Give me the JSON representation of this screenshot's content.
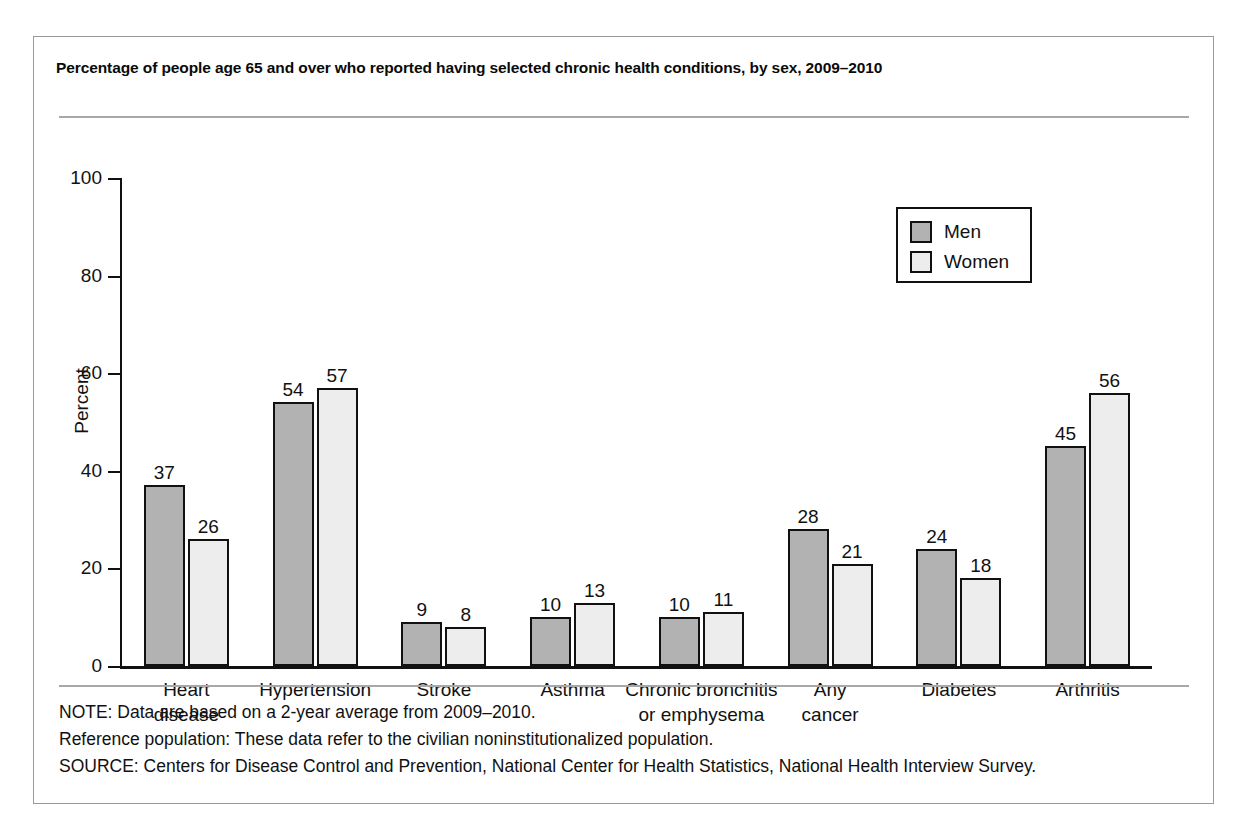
{
  "figure": {
    "title": "Percentage of people age 65 and over who reported having selected chronic health conditions, by sex, 2009–2010"
  },
  "footer": {
    "note": "NOTE: Data are based on a 2-year average from 2009–2010.",
    "reference": "Reference population: These data refer to the civilian noninstitutionalized population.",
    "source": "SOURCE: Centers for Disease Control and Prevention, National Center for Health Statistics, National Health Interview Survey."
  },
  "legend": {
    "items": [
      {
        "label": "Men",
        "color": "#b2b2b2"
      },
      {
        "label": "Women",
        "color": "#ededed"
      }
    ]
  },
  "axes": {
    "y_title": "Percent",
    "y_ticks": [
      "0",
      "20",
      "40",
      "60",
      "80",
      "100"
    ]
  },
  "chart_data": {
    "type": "bar",
    "title": "Percentage of people age 65 and over who reported having selected chronic health conditions, by sex, 2009–2010",
    "xlabel": "",
    "ylabel": "Percent",
    "ylim": [
      0,
      100
    ],
    "ytick_step": 20,
    "grid": false,
    "legend_position": "upper right",
    "categories": [
      "Heart disease",
      "Hypertension",
      "Stroke",
      "Asthma",
      "Chronic bronchitis or emphysema",
      "Any cancer",
      "Diabetes",
      "Arthritis"
    ],
    "category_lines": [
      [
        "Heart",
        "disease"
      ],
      [
        "Hypertension",
        ""
      ],
      [
        "Stroke",
        ""
      ],
      [
        "Asthma",
        ""
      ],
      [
        "Chronic bronchitis",
        "or emphysema"
      ],
      [
        "Any",
        "cancer"
      ],
      [
        "Diabetes",
        ""
      ],
      [
        "Arthritis",
        ""
      ]
    ],
    "series": [
      {
        "name": "Men",
        "color": "#b2b2b2",
        "values": [
          37,
          54,
          9,
          10,
          10,
          28,
          24,
          45
        ]
      },
      {
        "name": "Women",
        "color": "#ededed",
        "values": [
          26,
          57,
          8,
          13,
          11,
          21,
          18,
          56
        ]
      }
    ]
  }
}
